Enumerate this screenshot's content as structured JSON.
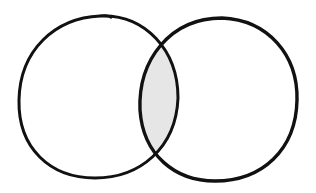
{
  "diagram": {
    "type": "venn",
    "sets": [
      {
        "name": "left-circle"
      },
      {
        "name": "right-circle"
      }
    ],
    "intersection": {
      "shaded": true
    },
    "colors": {
      "stroke": "#111111",
      "fill_intersection": "#e6e6e6",
      "background": "#ffffff"
    }
  }
}
